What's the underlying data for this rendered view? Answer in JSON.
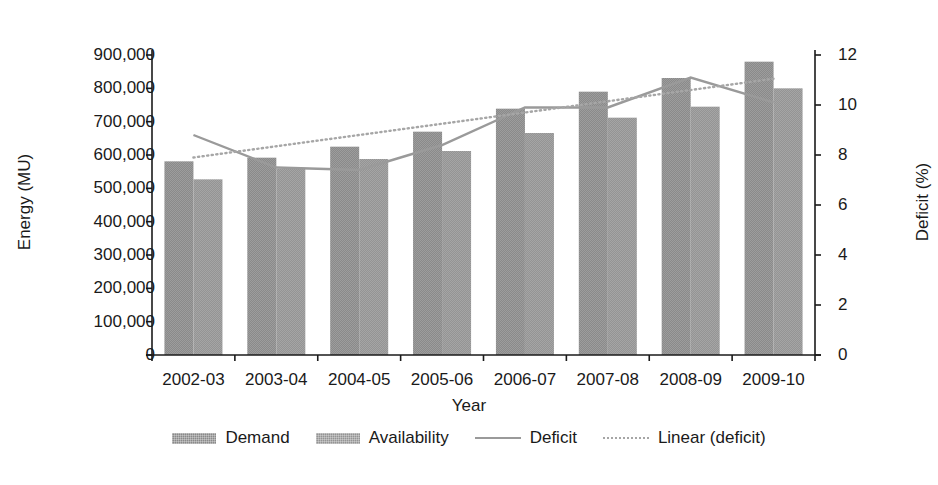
{
  "chart_data": {
    "type": "bar",
    "title": "",
    "xlabel": "Year",
    "ylabel": "Energy (MU)",
    "y2label": "Deficit (%)",
    "categories": [
      "2002-03",
      "2003-04",
      "2004-05",
      "2005-06",
      "2006-07",
      "2007-08",
      "2008-09",
      "2009-10"
    ],
    "ylim": [
      0,
      900000
    ],
    "y2lim": [
      0,
      12
    ],
    "yticks": [
      "0",
      "100,000",
      "200,000",
      "300,000",
      "400,000",
      "500,000",
      "600,000",
      "700,000",
      "800,000",
      "900,000"
    ],
    "y2ticks": [
      "0",
      "2",
      "4",
      "6",
      "8",
      "10",
      "12"
    ],
    "grid": false,
    "legend_position": "bottom",
    "series": [
      {
        "name": "Demand",
        "kind": "bar",
        "axis": "left",
        "color": "#8a8a8a",
        "values": [
          581000,
          592000,
          625000,
          670000,
          739000,
          790000,
          831000,
          880000
        ]
      },
      {
        "name": "Availability",
        "kind": "bar",
        "axis": "left",
        "color": "#949494",
        "values": [
          527000,
          559000,
          588000,
          612000,
          666000,
          712000,
          745000,
          800000
        ]
      },
      {
        "name": "Deficit",
        "kind": "line",
        "axis": "right",
        "color": "#9a9a9a",
        "values": [
          8.8,
          7.5,
          7.4,
          8.4,
          9.9,
          9.9,
          11.1,
          10.1
        ]
      },
      {
        "name": "Linear (deficit)",
        "kind": "trendline",
        "axis": "right",
        "color": "#a6a6a6",
        "values": [
          7.9,
          8.35,
          8.8,
          9.25,
          9.7,
          10.15,
          10.6,
          11.05
        ]
      }
    ]
  },
  "legend": {
    "items": [
      {
        "label": "Demand",
        "style": "bar-dark"
      },
      {
        "label": "Availability",
        "style": "bar-light"
      },
      {
        "label": "Deficit",
        "style": "line-solid"
      },
      {
        "label": "Linear (deficit)",
        "style": "line-dotted"
      }
    ]
  }
}
